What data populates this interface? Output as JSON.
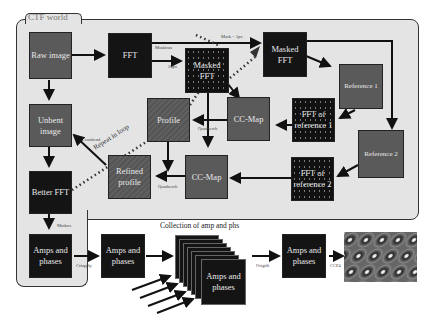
{
  "diagram": {
    "region_title": "CTF world",
    "nodes": {
      "raw_image": "Raw image",
      "fft": "FFT",
      "masked_fft_1": "Masked FFT",
      "masked_fft_2": "Masked FFT",
      "reference_1": "Reference 1",
      "reference_2": "Reference 2",
      "fft_ref_1": "FFT of reference 1",
      "fft_ref_2": "FFT of reference 2",
      "cc_map_1": "CC-Map",
      "cc_map_2": "CC-Map",
      "profile": "Profile",
      "refined_profile": "Refined profile",
      "unbent_image": "Unbent image",
      "better_fft": "Better FFT",
      "amps_phases_1": "Amps and phases",
      "amps_phases_2": "Amps and phases",
      "amps_phases_stack": "Amps and phases",
      "amps_phases_3": "Amps and phases"
    },
    "edge_labels": {
      "masktran": "Masktran",
      "px20": "20px",
      "mask_1px": "Mask = 1px",
      "quadserch_1": "Quadserch",
      "quadserch_2": "Quadserch",
      "ccunbend": "Ccunbend",
      "repeat_in_loop": "Repeat in loop",
      "mmbox": "Mmbox",
      "ctfapply": "Ctfapply",
      "origtilt": "Origtilt",
      "ccp4": "CCP4"
    },
    "collection_title": "Collection of amp and phs"
  }
}
